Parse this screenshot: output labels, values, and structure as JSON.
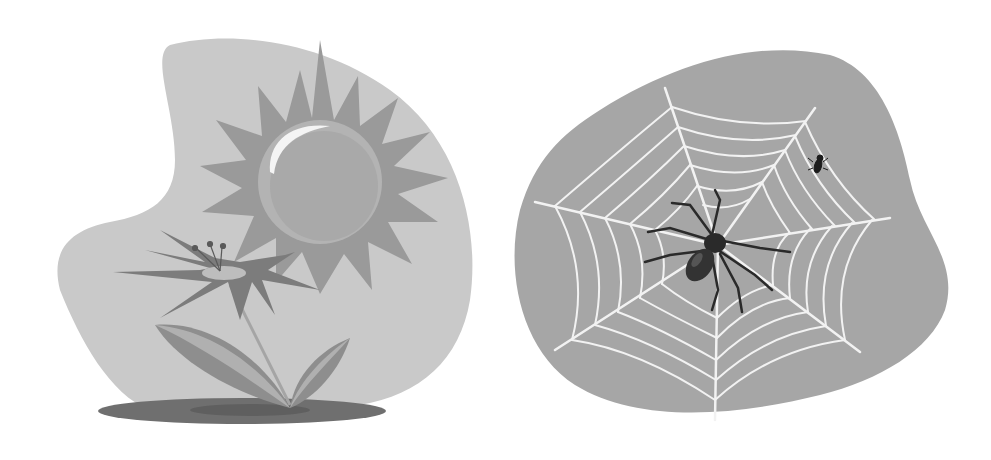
{
  "illustrations": [
    {
      "id": "left",
      "subject": "flower-and-sun",
      "elements": [
        "blob-background",
        "sun",
        "sun-highlight",
        "flower-petals",
        "flower-center",
        "stamens",
        "stem",
        "leaves",
        "ground-shadow"
      ]
    },
    {
      "id": "right",
      "subject": "spider-web",
      "elements": [
        "blob-background",
        "spider-web",
        "spider",
        "fly"
      ]
    }
  ],
  "colors": {
    "background": "#ffffff",
    "left_blob": "#c9c9c9",
    "sun_rays": "#9a9a9a",
    "sun_ring": "#b3b3b3",
    "sun_body": "#a9a9a9",
    "sun_highlight": "#f4f4f4",
    "petals": "#7c7c7c",
    "flower_center": "#bdbdbd",
    "stem": "#a5a5a5",
    "leaf_dark": "#8e8e8e",
    "leaf_light": "#b0b0b0",
    "shadow": "#6f6f6f",
    "right_blob": "#a6a6a6",
    "web": "#f2f2f2",
    "spider": "#2a2a2a",
    "fly": "#1c1c1c"
  }
}
